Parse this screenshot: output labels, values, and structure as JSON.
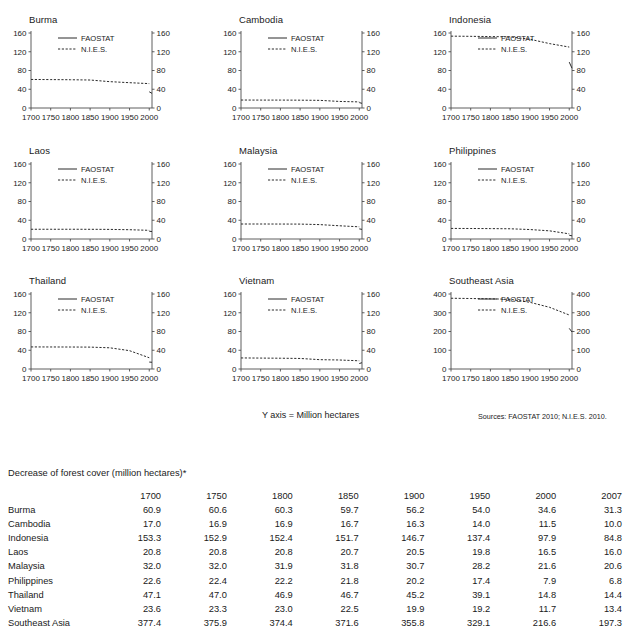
{
  "legend": {
    "series1": "FAOSTAT",
    "series2": "N.I.E.S."
  },
  "axis_note": "Y axis = Million hectares",
  "sources_note": "Sources: FAOSTAT 2010; N.I.E.S. 2010.",
  "table": {
    "caption": "Decrease of forest cover (million hectares)*",
    "rowhead_blank": "",
    "columns": [
      "1700",
      "1750",
      "1800",
      "1850",
      "1900",
      "1950",
      "2000",
      "2007"
    ],
    "rows": [
      {
        "label": "Burma",
        "values": [
          "60.9",
          "60.6",
          "60.3",
          "59.7",
          "56.2",
          "54.0",
          "34.6",
          "31.3"
        ]
      },
      {
        "label": "Cambodia",
        "values": [
          "17.0",
          "16.9",
          "16.9",
          "16.7",
          "16.3",
          "14.0",
          "11.5",
          "10.0"
        ]
      },
      {
        "label": "Indonesia",
        "values": [
          "153.3",
          "152.9",
          "152.4",
          "151.7",
          "146.7",
          "137.4",
          "97.9",
          "84.8"
        ]
      },
      {
        "label": "Laos",
        "values": [
          "20.8",
          "20.8",
          "20.8",
          "20.7",
          "20.5",
          "19.8",
          "16.5",
          "16.0"
        ]
      },
      {
        "label": "Malaysia",
        "values": [
          "32.0",
          "32.0",
          "31.9",
          "31.8",
          "30.7",
          "28.2",
          "21.6",
          "20.6"
        ]
      },
      {
        "label": "Philippines",
        "values": [
          "22.6",
          "22.4",
          "22.2",
          "21.8",
          "20.2",
          "17.4",
          "7.9",
          "6.8"
        ]
      },
      {
        "label": "Thailand",
        "values": [
          "47.1",
          "47.0",
          "46.9",
          "46.7",
          "45.2",
          "39.1",
          "14.8",
          "14.4"
        ]
      },
      {
        "label": "Vietnam",
        "values": [
          "23.6",
          "23.3",
          "23.0",
          "22.5",
          "19.9",
          "19.2",
          "11.7",
          "13.4"
        ]
      },
      {
        "label": "Southeast Asia",
        "values": [
          "377.4",
          "375.9",
          "374.4",
          "371.6",
          "355.8",
          "329.1",
          "216.6",
          "197.3"
        ]
      }
    ]
  },
  "chart_data": [
    {
      "type": "line",
      "title": "Burma",
      "xlabel": "",
      "ylabel": "",
      "xlim": [
        1700,
        2007
      ],
      "ylim": [
        0,
        160
      ],
      "yticks": [
        0,
        40,
        80,
        120,
        160
      ],
      "xticks": [
        1700,
        1750,
        1800,
        1850,
        1900,
        1950,
        2000
      ],
      "grid": false,
      "dual_y_axis": true,
      "legend_position": "upper-center",
      "x": [
        1700,
        1750,
        1800,
        1850,
        1900,
        1950,
        2000,
        2007
      ],
      "series": [
        {
          "name": "N.I.E.S.",
          "style": "dashed",
          "x": [
            1700,
            1750,
            1800,
            1850,
            1900,
            1950,
            2000
          ],
          "values": [
            60.9,
            60.6,
            60.3,
            59.7,
            56.2,
            54.0,
            52.0
          ]
        },
        {
          "name": "FAOSTAT",
          "style": "solid",
          "x": [
            2000,
            2007
          ],
          "values": [
            34.6,
            31.3
          ]
        }
      ]
    },
    {
      "type": "line",
      "title": "Cambodia",
      "xlabel": "",
      "ylabel": "",
      "xlim": [
        1700,
        2007
      ],
      "ylim": [
        0,
        160
      ],
      "yticks": [
        0,
        40,
        80,
        120,
        160
      ],
      "xticks": [
        1700,
        1750,
        1800,
        1850,
        1900,
        1950,
        2000
      ],
      "grid": false,
      "dual_y_axis": true,
      "legend_position": "upper-center",
      "series": [
        {
          "name": "N.I.E.S.",
          "style": "dashed",
          "x": [
            1700,
            1750,
            1800,
            1850,
            1900,
            1950,
            2000
          ],
          "values": [
            17.0,
            16.9,
            16.9,
            16.7,
            16.3,
            14.0,
            13.0
          ]
        },
        {
          "name": "FAOSTAT",
          "style": "solid",
          "x": [
            2000,
            2007
          ],
          "values": [
            11.5,
            10.0
          ]
        }
      ]
    },
    {
      "type": "line",
      "title": "Indonesia",
      "xlabel": "",
      "ylabel": "",
      "xlim": [
        1700,
        2007
      ],
      "ylim": [
        0,
        160
      ],
      "yticks": [
        0,
        40,
        80,
        120,
        160
      ],
      "xticks": [
        1700,
        1750,
        1800,
        1850,
        1900,
        1950,
        2000
      ],
      "grid": false,
      "dual_y_axis": true,
      "legend_position": "upper-center",
      "series": [
        {
          "name": "N.I.E.S.",
          "style": "dashed",
          "x": [
            1700,
            1750,
            1800,
            1850,
            1900,
            1950,
            2000
          ],
          "values": [
            153.3,
            152.9,
            152.4,
            151.7,
            146.7,
            137.4,
            130.0
          ]
        },
        {
          "name": "FAOSTAT",
          "style": "solid",
          "x": [
            2000,
            2007
          ],
          "values": [
            97.9,
            84.8
          ]
        }
      ]
    },
    {
      "type": "line",
      "title": "Laos",
      "xlabel": "",
      "ylabel": "",
      "xlim": [
        1700,
        2007
      ],
      "ylim": [
        0,
        160
      ],
      "yticks": [
        0,
        40,
        80,
        120,
        160
      ],
      "xticks": [
        1700,
        1750,
        1800,
        1850,
        1900,
        1950,
        2000
      ],
      "grid": false,
      "dual_y_axis": true,
      "legend_position": "upper-center",
      "series": [
        {
          "name": "N.I.E.S.",
          "style": "dashed",
          "x": [
            1700,
            1750,
            1800,
            1850,
            1900,
            1950,
            2000
          ],
          "values": [
            20.8,
            20.8,
            20.8,
            20.7,
            20.5,
            19.8,
            18.5
          ]
        },
        {
          "name": "FAOSTAT",
          "style": "solid",
          "x": [
            2000,
            2007
          ],
          "values": [
            16.5,
            16.0
          ]
        }
      ]
    },
    {
      "type": "line",
      "title": "Malaysia",
      "xlabel": "",
      "ylabel": "",
      "xlim": [
        1700,
        2007
      ],
      "ylim": [
        0,
        160
      ],
      "yticks": [
        0,
        40,
        80,
        120,
        160
      ],
      "xticks": [
        1700,
        1750,
        1800,
        1850,
        1900,
        1950,
        2000
      ],
      "grid": false,
      "dual_y_axis": true,
      "legend_position": "upper-center",
      "series": [
        {
          "name": "N.I.E.S.",
          "style": "dashed",
          "x": [
            1700,
            1750,
            1800,
            1850,
            1900,
            1950,
            2000
          ],
          "values": [
            32.0,
            32.0,
            31.9,
            31.8,
            30.7,
            28.2,
            26.0
          ]
        },
        {
          "name": "FAOSTAT",
          "style": "solid",
          "x": [
            2000,
            2007
          ],
          "values": [
            21.6,
            20.6
          ]
        }
      ]
    },
    {
      "type": "line",
      "title": "Philippines",
      "xlabel": "",
      "ylabel": "",
      "xlim": [
        1700,
        2007
      ],
      "ylim": [
        0,
        160
      ],
      "yticks": [
        0,
        40,
        80,
        120,
        160
      ],
      "xticks": [
        1700,
        1750,
        1800,
        1850,
        1900,
        1950,
        2000
      ],
      "grid": false,
      "dual_y_axis": true,
      "legend_position": "upper-center",
      "series": [
        {
          "name": "N.I.E.S.",
          "style": "dashed",
          "x": [
            1700,
            1750,
            1800,
            1850,
            1900,
            1950,
            2000
          ],
          "values": [
            22.6,
            22.4,
            22.2,
            21.8,
            20.2,
            17.4,
            11.0
          ]
        },
        {
          "name": "FAOSTAT",
          "style": "solid",
          "x": [
            2000,
            2007
          ],
          "values": [
            7.9,
            6.8
          ]
        }
      ]
    },
    {
      "type": "line",
      "title": "Thailand",
      "xlabel": "",
      "ylabel": "",
      "xlim": [
        1700,
        2007
      ],
      "ylim": [
        0,
        160
      ],
      "yticks": [
        0,
        40,
        80,
        120,
        160
      ],
      "xticks": [
        1700,
        1750,
        1800,
        1850,
        1900,
        1950,
        2000
      ],
      "grid": false,
      "dual_y_axis": true,
      "legend_position": "upper-center",
      "series": [
        {
          "name": "N.I.E.S.",
          "style": "dashed",
          "x": [
            1700,
            1750,
            1800,
            1850,
            1900,
            1950,
            2000
          ],
          "values": [
            47.1,
            47.0,
            46.9,
            46.7,
            45.2,
            39.1,
            24.0
          ]
        },
        {
          "name": "FAOSTAT",
          "style": "solid",
          "x": [
            2000,
            2007
          ],
          "values": [
            14.8,
            14.4
          ]
        }
      ]
    },
    {
      "type": "line",
      "title": "Vietnam",
      "xlabel": "",
      "ylabel": "",
      "xlim": [
        1700,
        2007
      ],
      "ylim": [
        0,
        160
      ],
      "yticks": [
        0,
        40,
        80,
        120,
        160
      ],
      "xticks": [
        1700,
        1750,
        1800,
        1850,
        1900,
        1950,
        2000
      ],
      "grid": false,
      "dual_y_axis": true,
      "legend_position": "upper-center",
      "series": [
        {
          "name": "N.I.E.S.",
          "style": "dashed",
          "x": [
            1700,
            1750,
            1800,
            1850,
            1900,
            1950,
            2000
          ],
          "values": [
            23.6,
            23.3,
            23.0,
            22.5,
            19.9,
            19.2,
            17.5
          ]
        },
        {
          "name": "FAOSTAT",
          "style": "solid",
          "x": [
            2000,
            2007
          ],
          "values": [
            11.7,
            13.4
          ]
        }
      ]
    },
    {
      "type": "line",
      "title": "Southeast Asia",
      "xlabel": "",
      "ylabel": "",
      "xlim": [
        1700,
        2007
      ],
      "ylim": [
        0,
        400
      ],
      "yticks": [
        0,
        100,
        200,
        300,
        400
      ],
      "xticks": [
        1700,
        1750,
        1800,
        1850,
        1900,
        1950,
        2000
      ],
      "grid": false,
      "dual_y_axis": true,
      "legend_position": "upper-center",
      "series": [
        {
          "name": "N.I.E.S.",
          "style": "dashed",
          "x": [
            1700,
            1750,
            1800,
            1850,
            1900,
            1950,
            2000
          ],
          "values": [
            377.4,
            375.9,
            374.4,
            371.6,
            355.8,
            329.1,
            288.0
          ]
        },
        {
          "name": "FAOSTAT",
          "style": "solid",
          "x": [
            2000,
            2007
          ],
          "values": [
            216.6,
            197.3
          ]
        }
      ]
    }
  ]
}
